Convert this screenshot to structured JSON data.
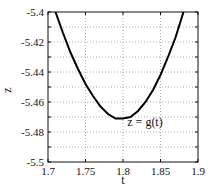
{
  "chart_data": {
    "type": "line",
    "title": "",
    "xlabel": "t",
    "ylabel": "z",
    "xlim": [
      1.7,
      1.9
    ],
    "ylim": [
      -5.5,
      -5.4
    ],
    "x_ticks": [
      "1.7",
      "1.75",
      "1.8",
      "1.85",
      "1.9"
    ],
    "y_ticks": [
      "-5.4",
      "-5.42",
      "-5.44",
      "-5.46",
      "-5.48",
      "-5.5"
    ],
    "grid": true,
    "annotation": "z = g(t)",
    "series": [
      {
        "name": "z = g(t)",
        "x": [
          1.71,
          1.72,
          1.73,
          1.74,
          1.75,
          1.76,
          1.77,
          1.78,
          1.79,
          1.8,
          1.81,
          1.82,
          1.83,
          1.84,
          1.85,
          1.86,
          1.87,
          1.88,
          1.89
        ],
        "values": [
          -5.4,
          -5.414,
          -5.427,
          -5.438,
          -5.448,
          -5.456,
          -5.463,
          -5.468,
          -5.471,
          -5.471,
          -5.47,
          -5.466,
          -5.46,
          -5.452,
          -5.442,
          -5.43,
          -5.417,
          -5.401,
          -5.384
        ]
      }
    ]
  }
}
